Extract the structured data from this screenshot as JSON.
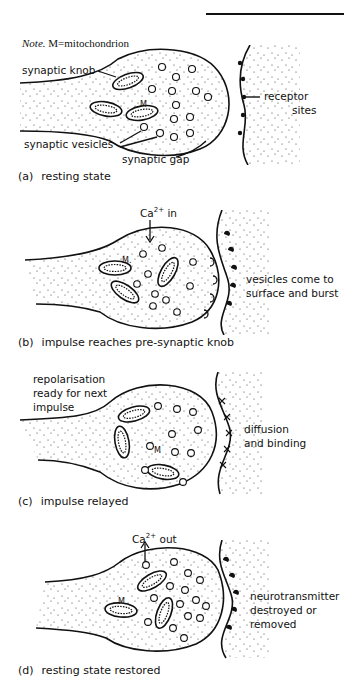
{
  "header": {
    "rule": true
  },
  "note": {
    "prefix": "Note.",
    "text": "M=mitochondrion"
  },
  "panels": [
    {
      "id": "a",
      "tag": "(a)",
      "caption": "resting state",
      "labels": {
        "synaptic_knob": "synaptic knob",
        "synaptic_vesicles": "synaptic vesicles",
        "synaptic_gap": "synaptic gap",
        "receptor_sites_1": "receptor",
        "receptor_sites_2": "sites",
        "mito_marker": "M"
      }
    },
    {
      "id": "b",
      "tag": "(b)",
      "caption": "impulse reaches pre-synaptic  knob",
      "labels": {
        "ion_base": "Ca",
        "ion_charge": "2+",
        "ion_dir": "in",
        "side_1": "vesicles come to",
        "side_2": "surface and burst",
        "mito_marker": "M."
      }
    },
    {
      "id": "c",
      "tag": "(c)",
      "caption": "impulse relayed",
      "labels": {
        "top_1": "repolarisation",
        "top_2": "ready for next",
        "top_3": "impulse",
        "side_1": "diffusion",
        "side_2": "and binding",
        "mito_marker": "M"
      }
    },
    {
      "id": "d",
      "tag": "(d)",
      "caption": "resting state restored",
      "labels": {
        "ion_base": "Ca",
        "ion_charge": "2+",
        "ion_dir": "out",
        "side_1": "neurotransmitter",
        "side_2": "destroyed or",
        "side_3": "removed",
        "mito_marker": "M"
      }
    }
  ],
  "colors": {
    "ink": "#111111",
    "background": "#ffffff"
  }
}
